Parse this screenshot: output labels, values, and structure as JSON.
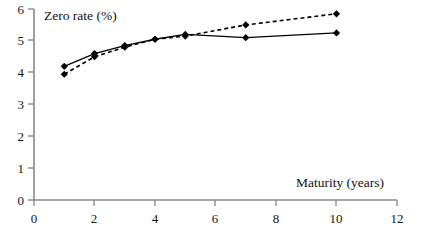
{
  "chart_data": {
    "type": "line",
    "title": "",
    "xlabel": "Maturity (years)",
    "ylabel": "Zero rate (%)",
    "xlim": [
      0,
      12
    ],
    "ylim": [
      0,
      6
    ],
    "xticks": [
      "0",
      "2",
      "4",
      "6",
      "8",
      "10",
      "12"
    ],
    "xtick_values": [
      0,
      2,
      4,
      6,
      8,
      10,
      12
    ],
    "yticks": [
      "0",
      "1",
      "2",
      "3",
      "4",
      "5",
      "6"
    ],
    "ytick_values": [
      0,
      1,
      2,
      3,
      4,
      5,
      6
    ],
    "grid": false,
    "legend": "none",
    "x": [
      1,
      2,
      3,
      4,
      5,
      7,
      10
    ],
    "series": [
      {
        "name": "solid-series",
        "style": "solid",
        "marker": "diamond",
        "color": "#000000",
        "values": [
          4.2,
          4.6,
          4.85,
          5.05,
          5.2,
          5.1,
          5.25
        ]
      },
      {
        "name": "dashed-series",
        "style": "dashed",
        "marker": "diamond",
        "color": "#000000",
        "values": [
          3.95,
          4.5,
          4.8,
          5.05,
          5.15,
          5.5,
          5.85
        ]
      }
    ]
  },
  "axis": {
    "y_title": "Zero rate (%)",
    "x_title": "Maturity (years)"
  },
  "colors": {
    "axis": "#8a8a8a",
    "ink": "#000000",
    "background": "#ffffff"
  }
}
